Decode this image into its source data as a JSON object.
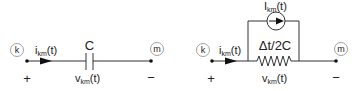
{
  "diagram": {
    "colors": {
      "wire": "#333333",
      "node_circle": "#8a8a8a",
      "text": "#222222",
      "background": "#ffffff"
    },
    "left_circuit": {
      "node_k": "k",
      "node_m": "m",
      "current_label_main": "i",
      "current_label_sub": "km",
      "current_label_suffix": "(t)",
      "element_label": "C",
      "voltage_label_main": "v",
      "voltage_label_sub": "km",
      "voltage_label_suffix": "(t)",
      "plus": "+",
      "minus": "−",
      "element_type": "capacitor"
    },
    "right_circuit": {
      "node_k": "k",
      "node_m": "m",
      "current_label_main": "i",
      "current_label_sub": "km",
      "current_label_suffix": "(t)",
      "source_label_main": "I",
      "source_label_sub": "km",
      "source_label_suffix": "(t)",
      "resistor_label": "Δt/2C",
      "voltage_label_main": "v",
      "voltage_label_sub": "km",
      "voltage_label_suffix": "(t)",
      "plus": "+",
      "minus": "−",
      "element_type": "resistor-with-parallel-current-source"
    }
  }
}
